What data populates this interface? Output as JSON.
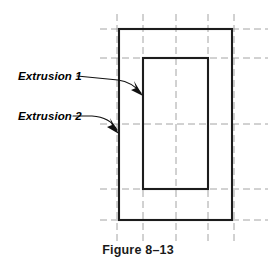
{
  "figure": {
    "caption": "Figure 8–13",
    "background_color": "#ffffff",
    "line_color": "#1c1c1c",
    "centerline_color": "#9a9a9a",
    "text_color": "#000000"
  },
  "annotations": {
    "label_1": "Extrusion 1",
    "label_2": "Extrusion 2"
  },
  "drawing": {
    "view_type": "orthographic front view",
    "outer_rectangle": {
      "name": "Extrusion 2",
      "x": 119,
      "y": 29,
      "width": 113,
      "height": 191
    },
    "inner_rectangle": {
      "name": "Extrusion 1",
      "x": 143,
      "y": 58,
      "width": 65,
      "height": 131
    },
    "vertical_centerlines_x": [
      117,
      143,
      176,
      208,
      234
    ],
    "horizontal_centerlines_y": [
      29,
      58,
      124,
      189,
      220
    ],
    "centerline_span_x": [
      100,
      268
    ],
    "centerline_span_y": [
      14,
      241
    ]
  }
}
